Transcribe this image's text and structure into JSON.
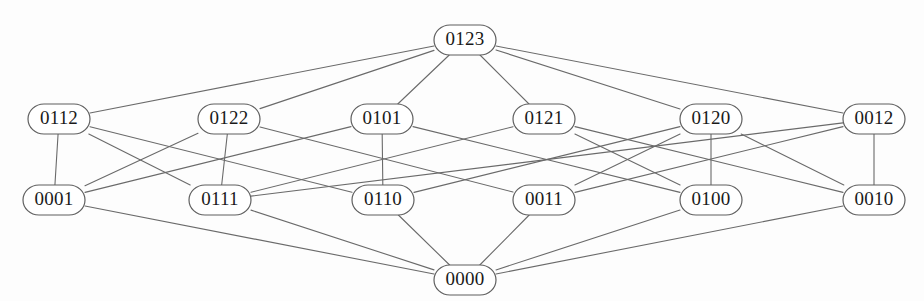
{
  "figure": {
    "kind": "hasse-diagram",
    "background_color": "#fdfdfd",
    "edge_color": "#6a6a6a",
    "node_fill": "#ffffff",
    "node_stroke": "#5f5f5f",
    "label_color": "#1a1a1a"
  },
  "graph": {
    "nodes": [
      {
        "id": "0123",
        "label": "0123",
        "x": 465,
        "y": 40,
        "rank": 0
      },
      {
        "id": "0112",
        "label": "0112",
        "x": 59,
        "y": 119,
        "rank": 1
      },
      {
        "id": "0122",
        "label": "0122",
        "x": 229,
        "y": 119,
        "rank": 1
      },
      {
        "id": "0101",
        "label": "0101",
        "x": 382,
        "y": 119,
        "rank": 1
      },
      {
        "id": "0121",
        "label": "0121",
        "x": 544,
        "y": 119,
        "rank": 1
      },
      {
        "id": "0120",
        "label": "0120",
        "x": 711,
        "y": 119,
        "rank": 1
      },
      {
        "id": "0012",
        "label": "0012",
        "x": 874,
        "y": 119,
        "rank": 1
      },
      {
        "id": "0001",
        "label": "0001",
        "x": 54,
        "y": 200,
        "rank": 2
      },
      {
        "id": "0111",
        "label": "0111",
        "x": 220,
        "y": 200,
        "rank": 2
      },
      {
        "id": "0110",
        "label": "0110",
        "x": 383,
        "y": 200,
        "rank": 2
      },
      {
        "id": "0011",
        "label": "0011",
        "x": 544,
        "y": 200,
        "rank": 2
      },
      {
        "id": "0100",
        "label": "0100",
        "x": 711,
        "y": 200,
        "rank": 2
      },
      {
        "id": "0010",
        "label": "0010",
        "x": 874,
        "y": 200,
        "rank": 2
      },
      {
        "id": "0000",
        "label": "0000",
        "x": 465,
        "y": 280,
        "rank": 3
      }
    ],
    "node_size": {
      "rx": 16,
      "ry": 15,
      "width": 62,
      "height": 30
    },
    "edges": [
      {
        "from": "0123",
        "to": "0112"
      },
      {
        "from": "0123",
        "to": "0122"
      },
      {
        "from": "0123",
        "to": "0101"
      },
      {
        "from": "0123",
        "to": "0121"
      },
      {
        "from": "0123",
        "to": "0120"
      },
      {
        "from": "0123",
        "to": "0012"
      },
      {
        "from": "0112",
        "to": "0001"
      },
      {
        "from": "0112",
        "to": "0111"
      },
      {
        "from": "0112",
        "to": "0110"
      },
      {
        "from": "0122",
        "to": "0111"
      },
      {
        "from": "0122",
        "to": "0001"
      },
      {
        "from": "0122",
        "to": "0011"
      },
      {
        "from": "0101",
        "to": "0001"
      },
      {
        "from": "0101",
        "to": "0110"
      },
      {
        "from": "0101",
        "to": "0100"
      },
      {
        "from": "0121",
        "to": "0111"
      },
      {
        "from": "0121",
        "to": "0010"
      },
      {
        "from": "0121",
        "to": "0100"
      },
      {
        "from": "0120",
        "to": "0110"
      },
      {
        "from": "0120",
        "to": "0011"
      },
      {
        "from": "0120",
        "to": "0100"
      },
      {
        "from": "0120",
        "to": "0010"
      },
      {
        "from": "0012",
        "to": "0011"
      },
      {
        "from": "0012",
        "to": "0010"
      },
      {
        "from": "0012",
        "to": "0111"
      },
      {
        "from": "0001",
        "to": "0000"
      },
      {
        "from": "0111",
        "to": "0000"
      },
      {
        "from": "0110",
        "to": "0000"
      },
      {
        "from": "0011",
        "to": "0000"
      },
      {
        "from": "0100",
        "to": "0000"
      },
      {
        "from": "0010",
        "to": "0000"
      }
    ]
  }
}
